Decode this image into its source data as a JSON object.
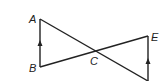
{
  "diagram": {
    "type": "geometry",
    "labels": {
      "A": "A",
      "B": "B",
      "C": "C",
      "E": "E"
    },
    "points": {
      "A": [
        40,
        19
      ],
      "B": [
        40,
        67
      ],
      "C": [
        95,
        51
      ],
      "E": [
        148,
        36
      ],
      "D": [
        148,
        81
      ]
    },
    "segments": [
      [
        "A",
        "B"
      ],
      [
        "A",
        "D"
      ],
      [
        "B",
        "E"
      ],
      [
        "E",
        "D"
      ]
    ],
    "parallel_marks": [
      "AB",
      "ED"
    ],
    "colors": {
      "line": "#222222",
      "background": "#ffffff"
    }
  }
}
